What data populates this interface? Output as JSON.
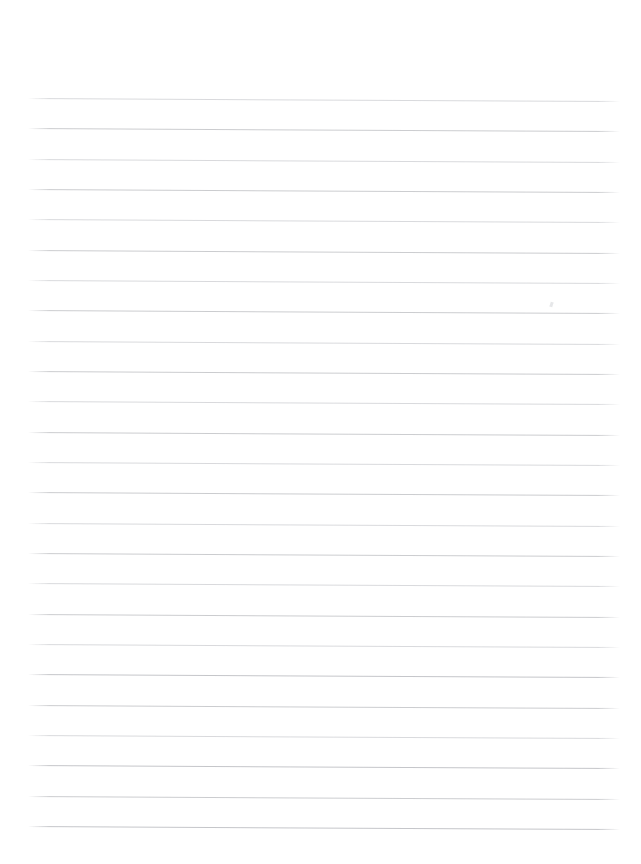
{
  "page": {
    "kind": "lined-paper-sheet",
    "width_px": 641,
    "height_px": 864,
    "background_color": "#ffffff",
    "text_content": "",
    "note": "No text, headings, labels or controls are present on the page."
  },
  "ruling": {
    "line_color": "#c9cacd",
    "line_color_faint": "#d7d8db",
    "line_color_strong": "#c2c3c7",
    "line_thickness_px": 1,
    "line_count": 25,
    "left_margin_px": 28,
    "right_end_px": 620,
    "first_line_y_px": 98,
    "last_line_y_px": 826,
    "line_spacing_px": 30.4,
    "tilt_deg": 0.3,
    "lines": [
      {
        "y": 98,
        "weight": "faint"
      },
      {
        "y": 128,
        "weight": "normal"
      },
      {
        "y": 159,
        "weight": "faint"
      },
      {
        "y": 189,
        "weight": "normal"
      },
      {
        "y": 219,
        "weight": "faint"
      },
      {
        "y": 250,
        "weight": "normal"
      },
      {
        "y": 280,
        "weight": "faint"
      },
      {
        "y": 310,
        "weight": "normal"
      },
      {
        "y": 341,
        "weight": "faint"
      },
      {
        "y": 371,
        "weight": "normal"
      },
      {
        "y": 401,
        "weight": "faint"
      },
      {
        "y": 432,
        "weight": "normal"
      },
      {
        "y": 462,
        "weight": "faint"
      },
      {
        "y": 492,
        "weight": "normal"
      },
      {
        "y": 523,
        "weight": "faint"
      },
      {
        "y": 553,
        "weight": "normal"
      },
      {
        "y": 583,
        "weight": "faint"
      },
      {
        "y": 614,
        "weight": "normal"
      },
      {
        "y": 644,
        "weight": "faint"
      },
      {
        "y": 674,
        "weight": "strong"
      },
      {
        "y": 705,
        "weight": "normal"
      },
      {
        "y": 735,
        "weight": "faint"
      },
      {
        "y": 765,
        "weight": "strong"
      },
      {
        "y": 796,
        "weight": "normal"
      },
      {
        "y": 826,
        "weight": "strong"
      }
    ]
  },
  "marks": [
    {
      "name": "pencil-smudge",
      "x": 550,
      "y": 302
    }
  ]
}
